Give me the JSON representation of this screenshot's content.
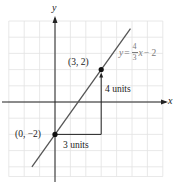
{
  "chart_data": {
    "type": "line",
    "title": "",
    "xlabel": "x",
    "ylabel": "y",
    "xlim": [
      -3,
      7
    ],
    "ylim": [
      -4.6,
      5
    ],
    "grid": true,
    "equation": {
      "lhs": "y",
      "eq": "=",
      "numerator": "4",
      "denominator": "3",
      "var": "x",
      "tail": "− 2"
    },
    "series": [
      {
        "name": "y = 4/3 x - 2",
        "x": [
          -1.5,
          4.9
        ],
        "y": [
          -4,
          4.53
        ],
        "slope": 1.3333,
        "intercept": -2,
        "color": "#555555"
      }
    ],
    "points": [
      {
        "x": 3,
        "y": 2,
        "label": "(3, 2)"
      },
      {
        "x": 0,
        "y": -2,
        "label": "(0, −2)"
      }
    ],
    "annotations": {
      "run_label": "3 units",
      "rise_label": "4 units"
    }
  },
  "colors": {
    "grid": "#e2e2e2",
    "axis": "#222222",
    "line": "#555555",
    "point": "#111111",
    "equation": "#7a7a7a"
  }
}
